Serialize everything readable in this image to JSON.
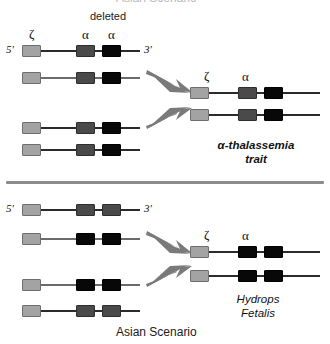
{
  "figure": {
    "title_top": "Asian Scenario",
    "title_bottom": "Asian Scenario",
    "deleted_label": "deleted",
    "five_prime": "5'",
    "three_prime": "3'",
    "zeta_symbol": "ζ",
    "alpha_symbol": "α",
    "divider_color": "#8c8c8c",
    "arrow_color": "#7a7a7a",
    "line_color_dark": "#2b2b2b",
    "line_color_gray": "#6b6b6b",
    "gene_light": "#a3a3a3",
    "gene_mid": "#4a4a4a",
    "gene_dark": "#080808"
  },
  "panels": [
    {
      "id": "top-panel",
      "outcome_line1": "α-thalassemia",
      "outcome_line2": "trait",
      "outcome_bold": true,
      "parent_labels": {
        "zeta": "ζ",
        "alpha_present": "α",
        "alpha_deleted": "α",
        "deleted": "deleted"
      },
      "result_labels": {
        "zeta": "ζ",
        "alpha": "α"
      },
      "parent_chromosomes": [
        {
          "name": "parent-chromosome-1",
          "genes": [
            "light",
            "mid",
            "dark"
          ],
          "show_ends": true
        },
        {
          "name": "parent-chromosome-2",
          "genes": [
            "light",
            "mid",
            "dark"
          ],
          "show_ends": false
        },
        {
          "name": "parent-chromosome-3",
          "genes": [
            "light",
            "mid",
            "dark"
          ],
          "show_ends": false
        },
        {
          "name": "parent-chromosome-4",
          "genes": [
            "light",
            "mid",
            "dark"
          ],
          "show_ends": false
        }
      ],
      "result_chromosomes": [
        {
          "name": "result-chromosome-1",
          "genes": [
            "light",
            "mid",
            "dark"
          ]
        },
        {
          "name": "result-chromosome-2",
          "genes": [
            "light",
            "mid",
            "dark"
          ]
        }
      ]
    },
    {
      "id": "bottom-panel",
      "outcome_line1": "Hydrops",
      "outcome_line2": "Fetalis",
      "outcome_bold": false,
      "parent_labels": {
        "zeta": "ζ",
        "alpha_present": "α",
        "alpha_deleted": "α",
        "deleted": "deleted"
      },
      "result_labels": {
        "zeta": "ζ",
        "alpha": "α"
      },
      "parent_chromosomes": [
        {
          "name": "parent-chromosome-1",
          "genes": [
            "light",
            "mid",
            "mid"
          ],
          "show_ends": true
        },
        {
          "name": "parent-chromosome-2",
          "genes": [
            "light",
            "dark",
            "dark"
          ],
          "show_ends": false
        },
        {
          "name": "parent-chromosome-3",
          "genes": [
            "light",
            "dark",
            "dark"
          ],
          "show_ends": false
        },
        {
          "name": "parent-chromosome-4",
          "genes": [
            "light",
            "mid",
            "mid"
          ],
          "show_ends": false
        }
      ],
      "result_chromosomes": [
        {
          "name": "result-chromosome-1",
          "genes": [
            "light",
            "dark",
            "dark"
          ]
        },
        {
          "name": "result-chromosome-2",
          "genes": [
            "light",
            "dark",
            "dark"
          ]
        }
      ]
    }
  ]
}
